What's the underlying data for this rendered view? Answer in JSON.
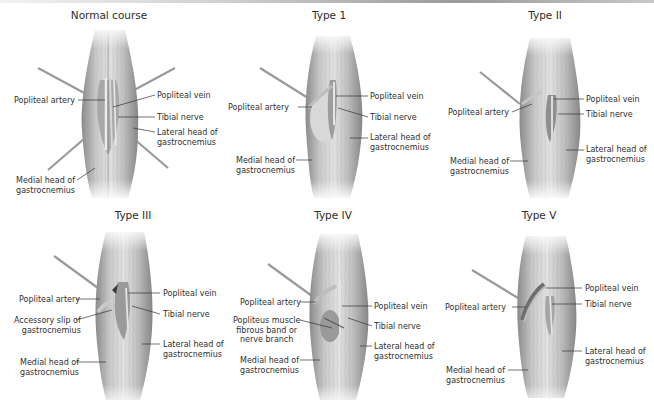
{
  "figure": {
    "panels": [
      {
        "id": "normal",
        "title": "Normal course",
        "labels": {
          "popliteal_artery": "Popliteal artery",
          "popliteal_vein": "Popliteal vein",
          "tibial_nerve": "Tibial nerve",
          "lateral_head_1": "Lateral head of",
          "lateral_head_2": "gastrocnemius",
          "medial_head_1": "Medial head of",
          "medial_head_2": "gastrocnemius"
        }
      },
      {
        "id": "type1",
        "title": "Type 1",
        "labels": {
          "popliteal_artery": "Popliteal artery",
          "popliteal_vein": "Popliteal vein",
          "tibial_nerve": "Tibial nerve",
          "lateral_head_1": "Lateral head of",
          "lateral_head_2": "gastrocnemius",
          "medial_head_1": "Medial head of",
          "medial_head_2": "gastrocnemius"
        }
      },
      {
        "id": "type2",
        "title": "Type II",
        "labels": {
          "popliteal_artery": "Popliteal artery",
          "popliteal_vein": "Popliteal vein",
          "tibial_nerve": "Tibial nerve",
          "lateral_head_1": "Lateral head of",
          "lateral_head_2": "gastrocnemius",
          "medial_head_1": "Medial head of",
          "medial_head_2": "gastrocnemius"
        }
      },
      {
        "id": "type3",
        "title": "Type III",
        "labels": {
          "popliteal_artery": "Popliteal artery",
          "popliteal_vein": "Popliteal vein",
          "tibial_nerve": "Tibial nerve",
          "accessory_slip_1": "Accessory slip of",
          "accessory_slip_2": "gastrocnemius",
          "lateral_head_1": "Lateral head of",
          "lateral_head_2": "gastrocnemius",
          "medial_head_1": "Medial head of",
          "medial_head_2": "gastrocnemius"
        }
      },
      {
        "id": "type4",
        "title": "Type IV",
        "labels": {
          "popliteal_artery": "Popliteal artery",
          "popliteal_vein": "Popliteal vein",
          "tibial_nerve": "Tibial nerve",
          "popliteus_1": "Popliteus muscle",
          "popliteus_2": "fibrous band or",
          "popliteus_3": "nerve branch",
          "lateral_head_1": "Lateral head of",
          "lateral_head_2": "gastrocnemius",
          "medial_head_1": "Medial head of",
          "medial_head_2": "gastrocnemius"
        }
      },
      {
        "id": "type5",
        "title": "Type V",
        "labels": {
          "popliteal_artery": "Popliteal artery",
          "popliteal_vein": "Popliteal vein",
          "tibial_nerve": "Tibial nerve",
          "lateral_head_1": "Lateral head of",
          "lateral_head_2": "gastrocnemius",
          "medial_head_1": "Medial head of",
          "medial_head_2": "gastrocnemius"
        }
      }
    ]
  },
  "colors": {
    "muscle_light": "#dcdcdc",
    "muscle_mid": "#b5b5b5",
    "muscle_dark": "#7d7d7d",
    "label_text": "#2f2f2f",
    "leader_line": "#333333",
    "retractor": "#9a9a9a"
  }
}
